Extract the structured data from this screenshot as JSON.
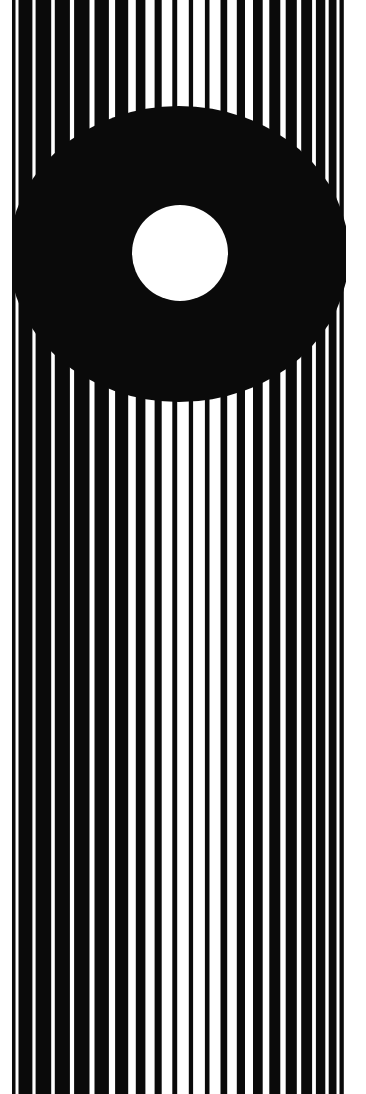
{
  "artwork": {
    "title": "Striped Field with Black Lens and White Disc",
    "medium": "high-contrast bitonal optical-art print",
    "canvas": {
      "width": 366,
      "height": 1094,
      "background_color": "#ffffff"
    },
    "palette": {
      "ink": "#0a0a0a",
      "paper": "#ffffff",
      "accent": "#000000"
    },
    "plate": {
      "label": "plate-area",
      "x": 12,
      "y": 0,
      "width": 334,
      "height": 1094,
      "fill_color": "#0a0a0a"
    },
    "stripes": {
      "label": "vertical-stripe-grating",
      "count": 23,
      "color": "#ffffff",
      "note": "stripe widths swell toward the horizontal center of the plate",
      "items": [
        {
          "id": "stripe-01",
          "center_x": 17,
          "width": 3.0
        },
        {
          "id": "stripe-02",
          "center_x": 34,
          "width": 3.2
        },
        {
          "id": "stripe-03",
          "center_x": 53,
          "width": 3.6
        },
        {
          "id": "stripe-04",
          "center_x": 72,
          "width": 4.2
        },
        {
          "id": "stripe-05",
          "center_x": 92,
          "width": 5.0
        },
        {
          "id": "stripe-06",
          "center_x": 112,
          "width": 6.2
        },
        {
          "id": "stripe-07",
          "center_x": 132,
          "width": 7.6
        },
        {
          "id": "stripe-08",
          "center_x": 150,
          "width": 9.2
        },
        {
          "id": "stripe-09",
          "center_x": 167,
          "width": 10.6
        },
        {
          "id": "stripe-10",
          "center_x": 183,
          "width": 11.6
        },
        {
          "id": "stripe-11",
          "center_x": 199,
          "width": 11.8
        },
        {
          "id": "stripe-12",
          "center_x": 215,
          "width": 11.0
        },
        {
          "id": "stripe-13",
          "center_x": 232,
          "width": 9.6
        },
        {
          "id": "stripe-14",
          "center_x": 249,
          "width": 8.0
        },
        {
          "id": "stripe-15",
          "center_x": 266,
          "width": 6.6
        },
        {
          "id": "stripe-16",
          "center_x": 283,
          "width": 5.4
        },
        {
          "id": "stripe-17",
          "center_x": 299,
          "width": 4.4
        },
        {
          "id": "stripe-18",
          "center_x": 314,
          "width": 3.8
        },
        {
          "id": "stripe-19",
          "center_x": 327,
          "width": 3.4
        },
        {
          "id": "stripe-20",
          "center_x": 338,
          "width": 3.0
        },
        {
          "id": "stripe-21",
          "center_x": 345,
          "width": 2.4
        },
        {
          "id": "stripe-22",
          "center_x": 6,
          "width": 2.0
        },
        {
          "id": "stripe-23",
          "center_x": 11,
          "width": 1.6
        }
      ]
    },
    "lens": {
      "label": "black-ellipse-occluder",
      "shape": "ellipse",
      "center_x": 179,
      "center_y": 254,
      "radius_x": 170,
      "radius_y": 148,
      "fill_color": "#0a0a0a",
      "note": "stripes terminate against this form, producing an apparent dark lens"
    },
    "disc": {
      "label": "white-disc",
      "shape": "circle",
      "center_x": 180,
      "center_y": 253,
      "radius": 48,
      "fill_color": "#ffffff"
    },
    "margins": {
      "left": 12,
      "right": 20,
      "top": 0,
      "bottom": 0,
      "color": "#ffffff"
    }
  }
}
